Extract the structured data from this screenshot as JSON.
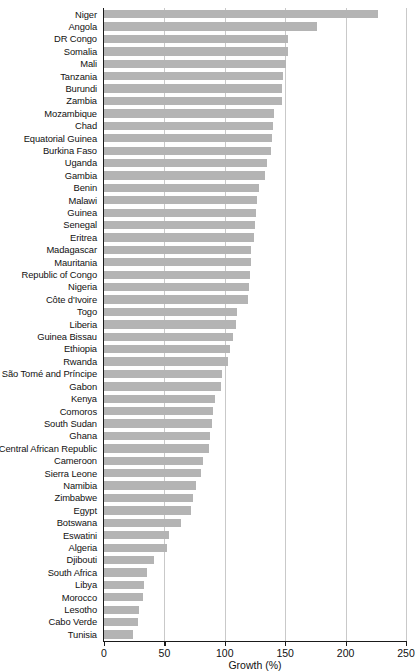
{
  "chart_data": {
    "type": "bar",
    "orientation": "horizontal",
    "title": "",
    "xlabel": "Growth (%)",
    "ylabel": "",
    "xlim": [
      0,
      250
    ],
    "ylim": null,
    "grid": "vertical",
    "legend": null,
    "xticks": [
      0,
      50,
      100,
      150,
      200,
      250
    ],
    "xtick_labels": [
      "0",
      "50",
      "100",
      "150",
      "200",
      "250"
    ],
    "bar_color": "#b4b4b4",
    "categories": [
      "Niger",
      "Angola",
      "DR Congo",
      "Somalia",
      "Mali",
      "Tanzania",
      "Burundi",
      "Zambia",
      "Mozambique",
      "Chad",
      "Equatorial Guinea",
      "Burkina Faso",
      "Uganda",
      "Gambia",
      "Benin",
      "Malawi",
      "Guinea",
      "Senegal",
      "Eritrea",
      "Madagascar",
      "Mauritania",
      "Republic of Congo",
      "Nigeria",
      "Côte d'Ivoire",
      "Togo",
      "Liberia",
      "Guinea Bissau",
      "Ethiopia",
      "Rwanda",
      "São Tomé and Príncipe",
      "Gabon",
      "Kenya",
      "Comoros",
      "South Sudan",
      "Ghana",
      "Central African Republic",
      "Cameroon",
      "Sierra Leone",
      "Namibia",
      "Zimbabwe",
      "Egypt",
      "Botswana",
      "Eswatini",
      "Algeria",
      "Djibouti",
      "South Africa",
      "Libya",
      "Morocco",
      "Lesotho",
      "Cabo Verde",
      "Tunisia"
    ],
    "values": [
      227,
      176,
      152,
      152,
      151,
      148,
      147,
      147,
      141,
      140,
      139,
      138,
      135,
      133,
      128,
      127,
      126,
      125,
      124,
      122,
      122,
      121,
      120,
      119,
      110,
      109,
      107,
      104,
      103,
      98,
      97,
      92,
      90,
      89,
      88,
      87,
      82,
      80,
      76,
      74,
      72,
      64,
      54,
      52,
      41,
      36,
      33,
      32,
      29,
      28,
      24
    ]
  }
}
